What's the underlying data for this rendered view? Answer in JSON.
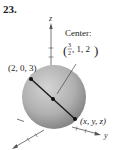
{
  "problem_number": "23.",
  "axes": {
    "x_label": "x",
    "y_label": "y",
    "z_label": "z"
  },
  "labels": {
    "center_title": "Center:",
    "center_frac_num": "3",
    "center_frac_den": "2",
    "center_rest": ", 1, 2",
    "point_a": "(2, 0, 3)",
    "point_b": "(x, y, z)"
  },
  "colors": {
    "sphere_light": "#d6d6d6",
    "sphere_dark": "#7d7d7d",
    "line": "#1a1a1a",
    "axis": "#555555"
  }
}
